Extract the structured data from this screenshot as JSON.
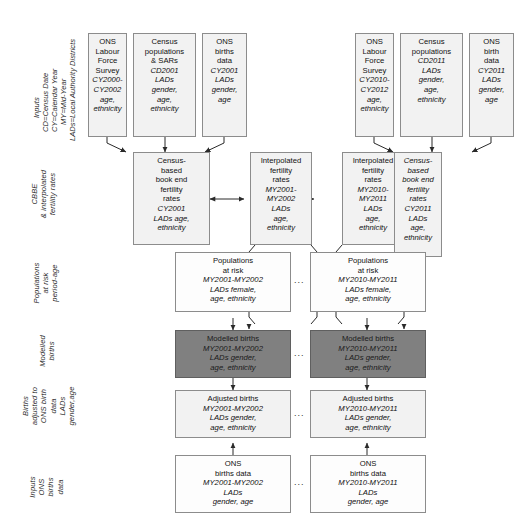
{
  "diagram": {
    "ellipsis": "...",
    "colors": {
      "box_light": "#efefef",
      "box_white": "#fdfdfd",
      "box_dark": "#808080",
      "border": "#8c8c8c",
      "text": "#111111"
    }
  },
  "row_labels": {
    "inputs_top": "Inputs",
    "cbbe": "CBBE\n& interpolated\nfertility rates",
    "populations": "Populations\nat risk\nperiod-age",
    "modelled": "Modelled\nbirths",
    "adjusted": "Births\nadjusted to\nONS birth\ndata\nLADs\ngender,age",
    "inputs_bottom": "Inputs\nONS\nbirths\ndata"
  },
  "legend": {
    "lines": [
      "Inputs",
      "CD=Census Date",
      "CY=Calendar Year",
      "MY=Mid-Year",
      "LADs=Local Authority Districts"
    ]
  },
  "row_inputs_top": {
    "boxes": [
      {
        "name": "ons-labour-force-survey-2000",
        "lines": [
          {
            "t": "ONS",
            "i": false
          },
          {
            "t": "Labour",
            "i": false
          },
          {
            "t": "Force",
            "i": false
          },
          {
            "t": "Survey",
            "i": false
          },
          {
            "t": "CY2000-",
            "i": true
          },
          {
            "t": "CY2002",
            "i": true
          },
          {
            "t": "age,",
            "i": true
          },
          {
            "t": "ethnicity",
            "i": true
          }
        ]
      },
      {
        "name": "census-populations-sars-cd2001",
        "lines": [
          {
            "t": "Census",
            "i": false
          },
          {
            "t": "populations",
            "i": false
          },
          {
            "t": "& SARs",
            "i": false
          },
          {
            "t": "CD2001",
            "i": true
          },
          {
            "t": "LADs",
            "i": true
          },
          {
            "t": "gender,",
            "i": true
          },
          {
            "t": "age,",
            "i": true
          },
          {
            "t": "ethnicity",
            "i": true
          }
        ]
      },
      {
        "name": "ons-births-data-cy2001",
        "lines": [
          {
            "t": "ONS",
            "i": false
          },
          {
            "t": "births",
            "i": false
          },
          {
            "t": "data",
            "i": false
          },
          {
            "t": "CY2001",
            "i": true
          },
          {
            "t": "LADs",
            "i": true
          },
          {
            "t": "gender,",
            "i": true
          },
          {
            "t": "age",
            "i": true
          }
        ]
      },
      {
        "name": "ons-labour-force-survey-2010",
        "lines": [
          {
            "t": "ONS",
            "i": false
          },
          {
            "t": "Labour",
            "i": false
          },
          {
            "t": "Force",
            "i": false
          },
          {
            "t": "Survey",
            "i": false
          },
          {
            "t": "CY2010-",
            "i": true
          },
          {
            "t": "CY2012",
            "i": true
          },
          {
            "t": "age,",
            "i": true
          },
          {
            "t": "ethnicity",
            "i": true
          }
        ]
      },
      {
        "name": "census-populations-cd2011",
        "lines": [
          {
            "t": "Census",
            "i": false
          },
          {
            "t": "populations",
            "i": false
          },
          {
            "t": "CD2011",
            "i": true
          },
          {
            "t": "LADs",
            "i": true
          },
          {
            "t": "gender,",
            "i": true
          },
          {
            "t": "age,",
            "i": true
          },
          {
            "t": "ethnicity",
            "i": true
          }
        ]
      },
      {
        "name": "ons-birth-data-cy2011",
        "lines": [
          {
            "t": "ONS",
            "i": false
          },
          {
            "t": "birth",
            "i": false
          },
          {
            "t": "data",
            "i": false
          },
          {
            "t": "CY2011",
            "i": true
          },
          {
            "t": "LADs",
            "i": true
          },
          {
            "t": "gender,",
            "i": true
          },
          {
            "t": "age",
            "i": true
          }
        ]
      }
    ]
  },
  "row_cbbe": {
    "boxes": [
      {
        "name": "census-based-book-end-fertility-rates-2001",
        "lines": [
          {
            "t": "Census-",
            "i": false
          },
          {
            "t": "based",
            "i": false
          },
          {
            "t": "book end",
            "i": false
          },
          {
            "t": "fertility",
            "i": false
          },
          {
            "t": "rates",
            "i": false
          },
          {
            "t": "CY2001",
            "i": true
          },
          {
            "t": "LADs age,",
            "i": true
          },
          {
            "t": "ethnicity",
            "i": true
          }
        ]
      },
      {
        "name": "interpolated-fertility-rates-my2001-my2002",
        "lines": [
          {
            "t": "Interpolated",
            "i": false
          },
          {
            "t": "fertility",
            "i": false
          },
          {
            "t": "rates",
            "i": false
          },
          {
            "t": "MY2001-",
            "i": true
          },
          {
            "t": "MY2002",
            "i": true
          },
          {
            "t": "LADs",
            "i": true
          },
          {
            "t": "age,",
            "i": true
          },
          {
            "t": "ethnicity",
            "i": true
          }
        ]
      },
      {
        "name": "interpolated-fertility-rates-my2010-my2011",
        "lines": [
          {
            "t": "Interpolated",
            "i": false
          },
          {
            "t": "fertility",
            "i": false
          },
          {
            "t": "rates",
            "i": false
          },
          {
            "t": "MY2010-",
            "i": true
          },
          {
            "t": "MY2011",
            "i": true
          },
          {
            "t": "LADs",
            "i": true
          },
          {
            "t": "age,",
            "i": true
          },
          {
            "t": "ethnicity",
            "i": true
          }
        ]
      },
      {
        "name": "census-based-book-end-fertility-rates-2011",
        "lines": [
          {
            "t": "Census-",
            "i": true
          },
          {
            "t": "based",
            "i": true
          },
          {
            "t": "book end",
            "i": true
          },
          {
            "t": "fertility",
            "i": true
          },
          {
            "t": "rates",
            "i": true
          },
          {
            "t": "CY2011",
            "i": true
          },
          {
            "t": "LADs",
            "i": true
          },
          {
            "t": "age,",
            "i": true
          },
          {
            "t": "ethnicity",
            "i": true
          }
        ]
      }
    ]
  },
  "row_populations": {
    "boxes": [
      {
        "name": "populations-at-risk-my2001-my2002",
        "lines": [
          {
            "t": "Populations",
            "i": false
          },
          {
            "t": "at risk",
            "i": false
          },
          {
            "t": "MY2001-MY2002",
            "i": true
          },
          {
            "t": "LADs female,",
            "i": true
          },
          {
            "t": "age, ethnicity",
            "i": true
          }
        ]
      },
      {
        "name": "populations-at-risk-my2010-my2011",
        "lines": [
          {
            "t": "Populations",
            "i": false
          },
          {
            "t": "at risk",
            "i": false
          },
          {
            "t": "MY2010-MY2011",
            "i": true
          },
          {
            "t": "LADs female,",
            "i": true
          },
          {
            "t": "age, ethnicity",
            "i": true
          }
        ]
      }
    ]
  },
  "row_modelled": {
    "boxes": [
      {
        "name": "modelled-births-my2001-my2002",
        "lines": [
          {
            "t": "Modelled births",
            "i": false
          },
          {
            "t": "MY2001-MY2002",
            "i": true
          },
          {
            "t": "LADs gender,",
            "i": true
          },
          {
            "t": "age, ethnicity",
            "i": true
          }
        ]
      },
      {
        "name": "modelled-births-my2010-my2011",
        "lines": [
          {
            "t": "Modelled births",
            "i": false
          },
          {
            "t": "MY2010-MY2011",
            "i": true
          },
          {
            "t": "LADs gender,",
            "i": true
          },
          {
            "t": "age, ethnicity",
            "i": true
          }
        ]
      }
    ]
  },
  "row_adjusted": {
    "boxes": [
      {
        "name": "adjusted-births-my2001-my2002",
        "lines": [
          {
            "t": "Adjusted births",
            "i": false
          },
          {
            "t": "MY2001-MY2002",
            "i": true
          },
          {
            "t": "LADs gender,",
            "i": true
          },
          {
            "t": "age, ethnicity",
            "i": true
          }
        ]
      },
      {
        "name": "adjusted-births-my2010-my2011",
        "lines": [
          {
            "t": "Adjusted births",
            "i": false
          },
          {
            "t": "MY2010-MY2011",
            "i": true
          },
          {
            "t": "LADs gender,",
            "i": true
          },
          {
            "t": "age, ethnicity",
            "i": true
          }
        ]
      }
    ]
  },
  "row_inputs_bottom": {
    "boxes": [
      {
        "name": "ons-births-data-my2001-my2002",
        "lines": [
          {
            "t": "ONS",
            "i": false
          },
          {
            "t": "births data",
            "i": false
          },
          {
            "t": "MY2001-MY2002",
            "i": true
          },
          {
            "t": "LADs",
            "i": true
          },
          {
            "t": "gender, age",
            "i": true
          }
        ]
      },
      {
        "name": "ons-births-data-my2010-my2011",
        "lines": [
          {
            "t": "ONS",
            "i": false
          },
          {
            "t": "births data",
            "i": false
          },
          {
            "t": "MY2010-MY2011",
            "i": true
          },
          {
            "t": "LADs",
            "i": true
          },
          {
            "t": "gender, age",
            "i": true
          }
        ]
      }
    ]
  }
}
